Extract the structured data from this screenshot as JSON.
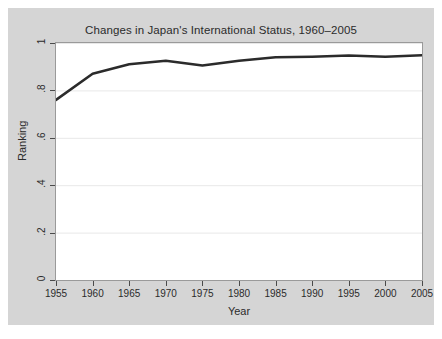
{
  "chart_data": {
    "type": "line",
    "title": "Changes in Japan's International Status, 1960–2005",
    "xlabel": "Year",
    "ylabel": "Ranking",
    "xlim": [
      1955,
      2005
    ],
    "ylim": [
      0,
      1
    ],
    "grid": true,
    "legend": null,
    "xticks": [
      1955,
      1960,
      1965,
      1970,
      1975,
      1980,
      1985,
      1990,
      1995,
      2000,
      2005
    ],
    "xtick_labels": [
      "1955",
      "1960",
      "1965",
      "1970",
      "1975",
      "1980",
      "1985",
      "1990",
      "1995",
      "2000",
      "2005"
    ],
    "yticks": [
      0,
      0.2,
      0.4,
      0.6,
      0.8,
      1
    ],
    "ytick_labels": [
      "0",
      ".2",
      ".4",
      ".6",
      ".8",
      "1"
    ],
    "x": [
      1955,
      1960,
      1965,
      1970,
      1975,
      1980,
      1985,
      1990,
      1995,
      2000,
      2005
    ],
    "series": [
      {
        "name": "Ranking",
        "color": "#2b2b2b",
        "line_width": 2.6,
        "values": [
          0.76,
          0.87,
          0.91,
          0.925,
          0.905,
          0.925,
          0.94,
          0.942,
          0.947,
          0.942,
          0.948
        ]
      }
    ]
  },
  "figure": {
    "background_color": "#d5d5d5",
    "plot_background_color": "#ffffff",
    "gridline_color": "#e8e8e8",
    "frame_color": "#9a9a9a",
    "axis_text_color": "#2b2b2b"
  }
}
